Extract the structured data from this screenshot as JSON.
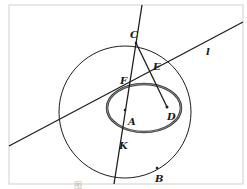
{
  "figure": {
    "type": "geometry-diagram",
    "colors": {
      "stroke": "#1e1e1e",
      "ellipse": "#3a3a3a",
      "frame": "#cfcfcf",
      "background": "#ffffff"
    },
    "frame": {
      "x": 9,
      "y": 5,
      "w": 234,
      "h": 179
    },
    "circle": {
      "cx": 125,
      "cy": 112,
      "r": 66
    },
    "ellipse": {
      "cx": 144,
      "cy": 108,
      "rx": 37,
      "ry": 24
    },
    "line_l": {
      "x1": 9,
      "y1": 146,
      "x2": 243,
      "y2": 22,
      "label": "l"
    },
    "line_CK": {
      "x1": 142,
      "y1": 5,
      "x2": 114,
      "y2": 184
    },
    "segment_CD": {
      "x1": 136,
      "y1": 43,
      "x2": 167,
      "y2": 107
    },
    "points": [
      {
        "name": "C",
        "x": 136,
        "y": 43,
        "lx": 130,
        "ly": 38
      },
      {
        "name": "E",
        "x": 152,
        "y": 71,
        "lx": 153,
        "ly": 70
      },
      {
        "name": "F",
        "x": 130,
        "y": 80,
        "lx": 120,
        "ly": 84
      },
      {
        "name": "A",
        "x": 125,
        "y": 110,
        "lx": 128,
        "ly": 125
      },
      {
        "name": "D",
        "x": 167,
        "y": 107,
        "lx": 167,
        "ly": 120
      },
      {
        "name": "K",
        "x": 121,
        "y": 132,
        "lx": 119,
        "ly": 149
      },
      {
        "name": "B",
        "x": 157,
        "y": 168,
        "lx": 155,
        "ly": 182
      }
    ],
    "caption": "图"
  }
}
